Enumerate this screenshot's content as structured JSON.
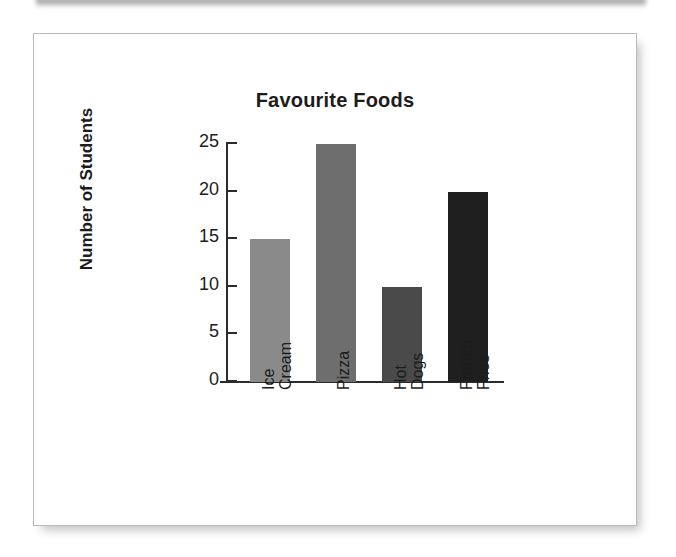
{
  "figure": {
    "title": "Favourite Foods",
    "y_axis_title": "Number of Students"
  },
  "chart_data": {
    "type": "bar",
    "title": "Favourite Foods",
    "xlabel": "",
    "ylabel": "Number of Students",
    "categories": [
      "Ice Cream",
      "Pizza",
      "Hot Dogs",
      "French Fries"
    ],
    "category_lines": [
      [
        "Ice",
        "Cream"
      ],
      [
        "Pizza"
      ],
      [
        "Hot",
        "Dogs"
      ],
      [
        "French",
        "Fries"
      ]
    ],
    "values": [
      15,
      25,
      10,
      20
    ],
    "bar_colors": [
      "#8a8a8a",
      "#6e6e6e",
      "#4a4a4a",
      "#1f1f1f"
    ],
    "ylim": [
      0,
      25
    ],
    "y_ticks": [
      0,
      5,
      10,
      15,
      20,
      25
    ],
    "y_tick_labels": [
      "0",
      "5",
      "10",
      "15",
      "20",
      "25"
    ],
    "grid": false,
    "legend": false
  }
}
